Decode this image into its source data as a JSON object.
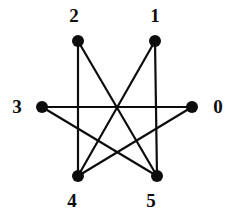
{
  "figure": {
    "name": "undirected-graph-diagram",
    "background_color": "#ffffff",
    "ink_color": "#0d0d0d",
    "width": 245,
    "height": 220
  },
  "graph": {
    "type": "undirected-graph",
    "vertex_count": 6,
    "edge_count": 7,
    "vertex_radius": 6,
    "edge_width": 2.2,
    "vertices": [
      {
        "id": "0",
        "label": "0",
        "x": 192,
        "y": 107,
        "label_x": 218,
        "label_y": 107,
        "degree": 2
      },
      {
        "id": "1",
        "label": "1",
        "x": 155,
        "y": 41,
        "label_x": 155,
        "label_y": 16,
        "degree": 2
      },
      {
        "id": "2",
        "label": "2",
        "x": 78,
        "y": 41,
        "label_x": 74,
        "label_y": 16,
        "degree": 2
      },
      {
        "id": "3",
        "label": "3",
        "x": 42,
        "y": 107,
        "label_x": 17,
        "label_y": 107,
        "degree": 2
      },
      {
        "id": "4",
        "label": "4",
        "x": 78,
        "y": 176,
        "label_x": 72,
        "label_y": 201,
        "degree": 3
      },
      {
        "id": "5",
        "label": "5",
        "x": 157,
        "y": 176,
        "label_x": 151,
        "label_y": 201,
        "degree": 3
      }
    ],
    "edges": [
      {
        "from": "3",
        "to": "0",
        "name": "edge-3-0"
      },
      {
        "from": "2",
        "to": "4",
        "name": "edge-2-4"
      },
      {
        "from": "1",
        "to": "5",
        "name": "edge-1-5"
      },
      {
        "from": "2",
        "to": "5",
        "name": "edge-2-5"
      },
      {
        "from": "1",
        "to": "4",
        "name": "edge-1-4"
      },
      {
        "from": "3",
        "to": "5",
        "name": "edge-3-5"
      },
      {
        "from": "0",
        "to": "4",
        "name": "edge-0-4"
      }
    ]
  }
}
